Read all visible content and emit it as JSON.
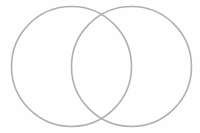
{
  "diagram": {
    "type": "venn",
    "set_count": 2,
    "background": "#fefefe",
    "stroke_color": "#b0b0b0",
    "stroke_width": 1.6,
    "circles": [
      {
        "id": "left",
        "cx": 71.5,
        "cy": 66.5,
        "r": 60,
        "label": ""
      },
      {
        "id": "right",
        "cx": 131.5,
        "cy": 66.5,
        "r": 60,
        "label": ""
      }
    ]
  }
}
